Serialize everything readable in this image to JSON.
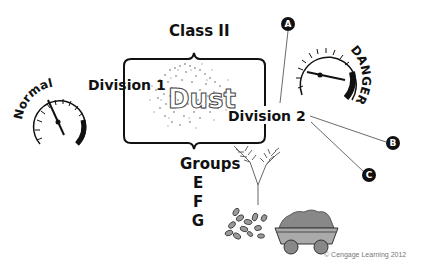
{
  "diagram": {
    "class_title": "Class II",
    "division_1": "Division 1",
    "division_2": "Division 2",
    "center_word": "Dust",
    "groups": {
      "title": "Groups",
      "letters": [
        "E",
        "F",
        "G"
      ]
    },
    "gauges": {
      "normal": {
        "label": "Normal",
        "needle": "low-mid"
      },
      "danger": {
        "label": "DANGER",
        "needle": "high"
      }
    },
    "callouts": [
      "A",
      "B",
      "C"
    ],
    "illustrations": [
      "grain-stalks",
      "seeds-pile",
      "ore-cart-with-coal"
    ],
    "copyright": "© Cengage Learning 2012"
  }
}
